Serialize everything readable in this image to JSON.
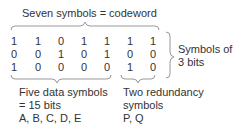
{
  "title": "Seven symbols = codeword",
  "grid": [
    [
      "1",
      "1",
      "0",
      "1",
      "1",
      "1",
      "1"
    ],
    [
      "0",
      "0",
      "1",
      "0",
      "1",
      "0",
      "0"
    ],
    [
      "1",
      "0",
      "0",
      "0",
      "0",
      "1",
      "0"
    ]
  ],
  "right_label": {
    "line1": "Symbols of",
    "line2": "3 bits"
  },
  "data_label": {
    "line1": "Five data symbols",
    "line2": "= 15 bits",
    "line3": "A, B, C, D, E"
  },
  "redundancy_label": {
    "line1": "Two redundancy",
    "line2": "symbols",
    "line3": "P, Q"
  }
}
